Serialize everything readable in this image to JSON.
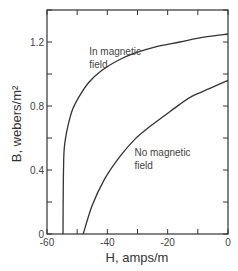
{
  "chart_data": {
    "type": "line",
    "title": "",
    "xlabel": "H,  amps/m",
    "ylabel": "B, webers/m²",
    "xlim": [
      -60,
      0
    ],
    "ylim": [
      0,
      1.4
    ],
    "grid": false,
    "legend": "none (inline curve annotations)",
    "x_ticks": [
      -60,
      -50,
      -40,
      -30,
      -20,
      -10,
      0
    ],
    "x_tick_labels": [
      "-60",
      "-40",
      "-20",
      "0"
    ],
    "x_tick_label_values": [
      -60,
      -40,
      -20,
      0
    ],
    "y_ticks": [
      0,
      0.2,
      0.4,
      0.6,
      0.8,
      1.0,
      1.2,
      1.4
    ],
    "y_tick_labels": [
      "0",
      "0.4",
      "0.8",
      "1.2"
    ],
    "y_tick_label_values": [
      0,
      0.4,
      0.8,
      1.2
    ],
    "series": [
      {
        "name": "In magnetic field",
        "label_lines": [
          "In magnetic",
          "field"
        ],
        "label_pos": [
          -46,
          1.12
        ],
        "x": [
          -54.7,
          -54.6,
          -54.4,
          -54.0,
          -53.0,
          -51.5,
          -49.0,
          -46.0,
          -42.0,
          -37.0,
          -31.0,
          -24.0,
          -16.0,
          -8.0,
          0.0
        ],
        "y": [
          0.0,
          0.3,
          0.5,
          0.58,
          0.68,
          0.78,
          0.87,
          0.95,
          1.02,
          1.08,
          1.13,
          1.17,
          1.2,
          1.23,
          1.25
        ]
      },
      {
        "name": "No magnetic field",
        "label_lines": [
          "No magnetic",
          "field"
        ],
        "label_pos": [
          -31,
          0.49
        ],
        "x": [
          -48.0,
          -45.0,
          -41.0,
          -36.0,
          -31.0,
          -26.0,
          -21.0,
          -16.0,
          -12.0,
          -6.0,
          0.0
        ],
        "y": [
          0.0,
          0.18,
          0.34,
          0.48,
          0.59,
          0.67,
          0.74,
          0.81,
          0.86,
          0.91,
          0.96
        ]
      }
    ]
  }
}
